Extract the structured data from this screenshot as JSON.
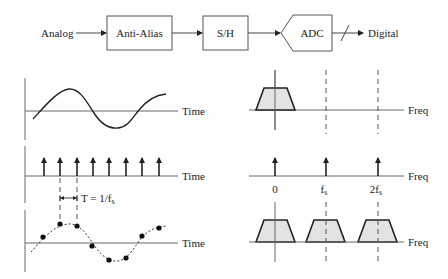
{
  "block_diagram": {
    "input_label": "Analog",
    "blocks": [
      {
        "label": "Anti-Alias"
      },
      {
        "label": "S/H"
      },
      {
        "label": "ADC"
      }
    ],
    "output_label": "Digital"
  },
  "time_domain": {
    "axis_label": "Time",
    "panels": [
      {
        "name": "analog-signal"
      },
      {
        "name": "impulse-train",
        "impulse_count": 8
      },
      {
        "name": "sampled-signal",
        "sample_count": 8
      }
    ],
    "period_label": "T = 1/f",
    "period_subscript": "s"
  },
  "freq_domain": {
    "axis_label": "Freq",
    "impulse_labels": [
      {
        "main": "0",
        "sub": ""
      },
      {
        "main": "f",
        "sub": "s"
      },
      {
        "main": "2f",
        "sub": "s"
      }
    ]
  }
}
